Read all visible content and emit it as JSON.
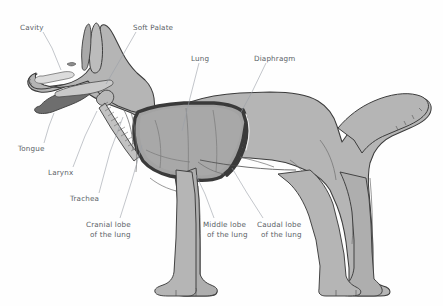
{
  "figure": {
    "view": "lateral left-side profile",
    "background_color": "#fefefe",
    "body_fill_color": "#b5b5b5",
    "body_outline_color": "#3c3c3c",
    "lung_fill_color": "#a8a8a8",
    "lung_outline_color": "#4a4a4a",
    "label_text_color": "#5a5f66",
    "leader_line_color": "#9aa0a8"
  },
  "labels": [
    {
      "id": "cavity",
      "text": "Cavity",
      "x": 20,
      "y": 27,
      "anchor": "start",
      "leader": "M 43,32 L 52,48 L 61,70"
    },
    {
      "id": "soft-palate",
      "text": "Soft Palate",
      "x": 133,
      "y": 27,
      "anchor": "start",
      "leader": "M 136,32 L 120,60 L 106,84"
    },
    {
      "id": "lung",
      "text": "Lung",
      "x": 191,
      "y": 58,
      "anchor": "start",
      "leader": "M 199,63 L 190,98 L 182,131"
    },
    {
      "id": "diaphragm",
      "text": "Diaphragm",
      "x": 254,
      "y": 58,
      "anchor": "start",
      "leader": "M 266,63 L 252,92 L 240,114"
    },
    {
      "id": "tongue",
      "text": "Tongue",
      "x": 18,
      "y": 148,
      "anchor": "start",
      "leader": "M 44,143 L 49,126 L 54,113"
    },
    {
      "id": "larynx",
      "text": "Larynx",
      "x": 48,
      "y": 172,
      "anchor": "start",
      "leader": "M 73,167 L 85,136 L 97,111"
    },
    {
      "id": "trachea",
      "text": "Trachea",
      "x": 70,
      "y": 198,
      "anchor": "start",
      "leader": "M 99,193 L 110,152 L 123,117"
    },
    {
      "id": "cranial-lobe",
      "line1": "Cranial lobe",
      "line2": "of the lung",
      "x": 86,
      "y": 224,
      "anchor": "start",
      "leader": "M 120,218 L 132,180 L 142,145"
    },
    {
      "id": "middle-lobe",
      "line1": "Middle lobe",
      "line2": "of the lung",
      "x": 203,
      "y": 224,
      "anchor": "start",
      "leader": "M 214,218 L 205,194 L 196,175"
    },
    {
      "id": "caudal-lobe",
      "line1": "Caudal lobe",
      "line2": "of the lung",
      "x": 257,
      "y": 224,
      "anchor": "start",
      "leader": "M 263,218 L 247,193 L 232,168"
    }
  ]
}
